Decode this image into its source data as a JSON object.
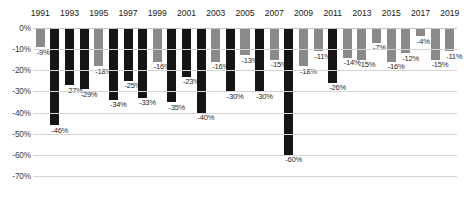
{
  "chart_data": {
    "type": "bar",
    "title": "",
    "xlabel": "",
    "ylabel": "",
    "ylim": [
      -70,
      0
    ],
    "grid": true,
    "legend": false,
    "y_ticks": [
      "0%",
      "-10%",
      "-20%",
      "-30%",
      "-40%",
      "-50%",
      "-60%",
      "-70%"
    ],
    "y_tick_values": [
      0,
      -10,
      -20,
      -30,
      -40,
      -50,
      -60,
      -70
    ],
    "x_tick_labels": [
      "1991",
      "1993",
      "1995",
      "1997",
      "1999",
      "2001",
      "2003",
      "2005",
      "2007",
      "2009",
      "2011",
      "2013",
      "2015",
      "2017",
      "2019"
    ],
    "categories": [
      "1991",
      "1992",
      "1993",
      "1994",
      "1995",
      "1996",
      "1997",
      "1998",
      "1999",
      "2000",
      "2001",
      "2002",
      "2003",
      "2004",
      "2005",
      "2006",
      "2007",
      "2008",
      "2009",
      "2010",
      "2011",
      "2012",
      "2013",
      "2014",
      "2015",
      "2016",
      "2017",
      "2018",
      "2019"
    ],
    "values": [
      -9,
      -46,
      -27,
      -29,
      -18,
      -34,
      -25,
      -33,
      -16,
      -35,
      -23,
      -40,
      -16,
      -30,
      -13,
      -30,
      -15,
      -60,
      -18,
      -11,
      -26,
      -14,
      -15,
      -7,
      -16,
      -12,
      -4,
      -15,
      -11
    ],
    "data_labels": [
      "-9%",
      "-46%",
      "-27%",
      "-29%",
      "-18%",
      "-34%",
      "-25%",
      "-33%",
      "-16%",
      "-35%",
      "-23%",
      "-40%",
      "-16%",
      "-30%",
      "-13%",
      "-30%",
      "-15%",
      "-60%",
      "-18%",
      "-11%",
      "-26%",
      "-14%",
      "-15%",
      "-7%",
      "-16%",
      "-12%",
      "-4%",
      "-15%",
      "-11%"
    ],
    "bar_colors": [
      "gray",
      "black",
      "black",
      "black",
      "gray",
      "black",
      "black",
      "black",
      "gray",
      "black",
      "black",
      "black",
      "gray",
      "black",
      "gray",
      "black",
      "gray",
      "black",
      "gray",
      "gray",
      "black",
      "gray",
      "gray",
      "gray",
      "gray",
      "gray",
      "gray",
      "gray",
      "gray"
    ],
    "colors": {
      "gray": "#8a8a8a",
      "black": "#151515",
      "grid": "#d4d4d4",
      "text": "#1a1a1a"
    }
  }
}
